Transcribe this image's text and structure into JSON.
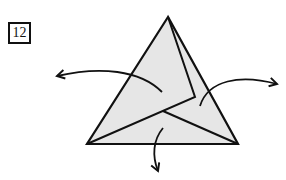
{
  "step": {
    "number": "12"
  },
  "diagram": {
    "colors": {
      "fill": "#e6e6e6",
      "stroke": "#111111",
      "background": "#ffffff"
    },
    "triangle": {
      "apex": [
        168,
        17
      ],
      "bottom_left": [
        87,
        144
      ],
      "bottom_right": [
        238,
        144
      ]
    },
    "arrows": [
      {
        "name": "left",
        "direction": "out-left"
      },
      {
        "name": "right",
        "direction": "out-right"
      },
      {
        "name": "down",
        "direction": "down"
      }
    ]
  }
}
